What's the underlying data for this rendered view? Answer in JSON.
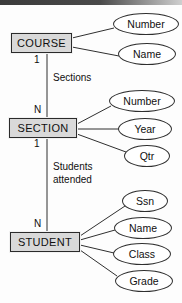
{
  "diagram": {
    "type": "entity-relationship-diagram",
    "line_color": "#2f2f2f",
    "entity_fill": "#d9d9d9",
    "attribute_fill": "#ffffff",
    "background": "#fdfdfd"
  },
  "entities": [
    {
      "id": "course",
      "label": "COURSE",
      "x": 11,
      "y": 33,
      "w": 61,
      "h": 20,
      "attributes": [
        {
          "label": "Number",
          "cx": 146,
          "cy": 24,
          "rx": 33,
          "ry": 11
        },
        {
          "label": "Name",
          "cx": 147,
          "cy": 54,
          "rx": 29,
          "ry": 11
        }
      ]
    },
    {
      "id": "section",
      "label": "SECTION",
      "x": 9,
      "y": 118,
      "w": 68,
      "h": 20,
      "attributes": [
        {
          "label": "Number",
          "cx": 142,
          "cy": 101,
          "rx": 33,
          "ry": 11
        },
        {
          "label": "Year",
          "cx": 145,
          "cy": 129,
          "rx": 27,
          "ry": 11
        },
        {
          "label": "Qtr",
          "cx": 147,
          "cy": 156,
          "rx": 23,
          "ry": 11
        }
      ]
    },
    {
      "id": "student",
      "label": "STUDENT",
      "x": 10,
      "y": 232,
      "w": 70,
      "h": 20,
      "attributes": [
        {
          "label": "Ssn",
          "cx": 145,
          "cy": 201,
          "rx": 23,
          "ry": 11
        },
        {
          "label": "Name",
          "cx": 143,
          "cy": 228,
          "rx": 29,
          "ry": 11
        },
        {
          "label": "Class",
          "cx": 142,
          "cy": 254,
          "rx": 29,
          "ry": 11
        },
        {
          "label": "Grade",
          "cx": 144,
          "cy": 281,
          "rx": 29,
          "ry": 11
        }
      ]
    }
  ],
  "relationships": [
    {
      "id": "sections",
      "label": "Sections",
      "from": "course",
      "to": "section",
      "from_cardinality": "1",
      "to_cardinality": "N",
      "label_x": 53,
      "label_y": 72,
      "from_card_x": 34,
      "from_card_y": 54,
      "to_card_x": 34,
      "to_card_y": 104,
      "line_x": 47,
      "line_y1": 53,
      "line_y2": 118
    },
    {
      "id": "students-attended",
      "label": "Students\nattended",
      "label_line1": "Students",
      "label_line2": "attended",
      "from": "section",
      "to": "student",
      "from_cardinality": "1",
      "to_cardinality": "N",
      "label_x": 53,
      "label_y": 161,
      "from_card_x": 34,
      "from_card_y": 138,
      "to_card_x": 34,
      "to_card_y": 218,
      "line_x": 47,
      "line_y1": 138,
      "line_y2": 232
    }
  ]
}
